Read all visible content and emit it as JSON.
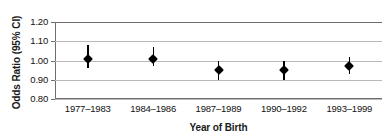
{
  "chart_data": {
    "type": "scatter",
    "title": "",
    "xlabel": "Year of Birth",
    "ylabel": "Odds Ratio (95% CI)",
    "categories": [
      "1977–1983",
      "1984–1986",
      "1987–1989",
      "1990–1992",
      "1993–1999"
    ],
    "values": [
      1.01,
      1.01,
      0.95,
      0.95,
      0.97
    ],
    "ci_lower": [
      0.96,
      0.97,
      0.9,
      0.9,
      0.93
    ],
    "ci_upper": [
      1.08,
      1.07,
      1.0,
      1.0,
      1.02
    ],
    "ylim": [
      0.8,
      1.2
    ],
    "yticks": [
      1.2,
      1.1,
      1.0,
      0.9,
      0.8
    ],
    "ytick_labels": [
      "1.20",
      "1.10",
      "1.00",
      "0.90",
      "0.80"
    ],
    "grid": true,
    "legend": "none",
    "marker": "filled-diamond",
    "series": [
      {
        "name": "Odds Ratio",
        "points": [
          {
            "category": "1977–1983",
            "value": 1.01,
            "ci_lower": 0.96,
            "ci_upper": 1.08
          },
          {
            "category": "1984–1986",
            "value": 1.01,
            "ci_lower": 0.97,
            "ci_upper": 1.07
          },
          {
            "category": "1987–1989",
            "value": 0.95,
            "ci_lower": 0.9,
            "ci_upper": 1.0
          },
          {
            "category": "1990–1992",
            "value": 0.95,
            "ci_lower": 0.9,
            "ci_upper": 1.0
          },
          {
            "category": "1993–1999",
            "value": 0.97,
            "ci_lower": 0.93,
            "ci_upper": 1.02
          }
        ]
      }
    ]
  },
  "colors": {
    "marker": "#000000",
    "errorbar": "#000000",
    "gridline": "#b9b9b9",
    "axis": "#6e6e6e",
    "text": "#111111",
    "background": "#ffffff"
  }
}
